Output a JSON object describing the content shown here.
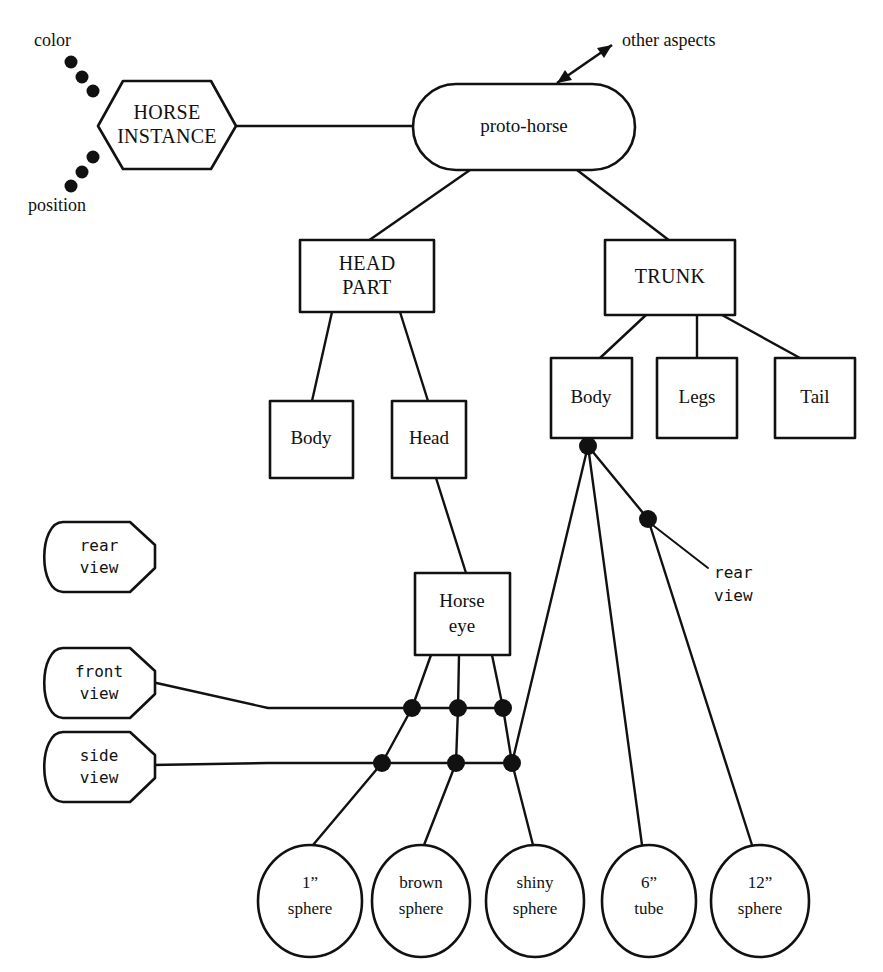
{
  "diagram": {
    "ink_color": "#111111",
    "background_color": "#ffffff",
    "instance_node": {
      "label_line1": "HORSE",
      "label_line2": "INSTANCE",
      "shape": "hexagon"
    },
    "prototype_node": {
      "label": "proto-horse",
      "shape": "stadium"
    },
    "annotations": {
      "color": "color",
      "position": "position",
      "other_aspects": "other aspects",
      "rear_view_body": "rear\nview",
      "rear_view_body_line1": "rear",
      "rear_view_body_line2": "view"
    },
    "part_nodes": [
      {
        "id": "head-part",
        "label_line1": "HEAD",
        "label_line2": "PART",
        "shape": "rect"
      },
      {
        "id": "trunk",
        "label_line1": "TRUNK",
        "label_line2": "",
        "shape": "rect"
      }
    ],
    "head_children": [
      {
        "id": "head-body",
        "label": "Body",
        "shape": "rect"
      },
      {
        "id": "head-head",
        "label": "Head",
        "shape": "rect"
      }
    ],
    "trunk_children": [
      {
        "id": "trunk-body",
        "label": "Body",
        "shape": "rect"
      },
      {
        "id": "trunk-legs",
        "label": "Legs",
        "shape": "rect"
      },
      {
        "id": "trunk-tail",
        "label": "Tail",
        "shape": "rect"
      }
    ],
    "eye_node": {
      "label_line1": "Horse",
      "label_line2": "eye",
      "shape": "rect"
    },
    "view_nodes": [
      {
        "id": "rear-view",
        "label_line1": "rear",
        "label_line2": "view",
        "shape": "flag"
      },
      {
        "id": "front-view",
        "label_line1": "front",
        "label_line2": "view",
        "shape": "flag"
      },
      {
        "id": "side-view",
        "label_line1": "side",
        "label_line2": "view",
        "shape": "flag"
      }
    ],
    "leaf_nodes": [
      {
        "id": "leaf-1in-sphere",
        "label_line1": "1”",
        "label_line2": "sphere",
        "shape": "ellipse"
      },
      {
        "id": "leaf-brown-sphere",
        "label_line1": "brown",
        "label_line2": "sphere",
        "shape": "ellipse"
      },
      {
        "id": "leaf-shiny-sphere",
        "label_line1": "shiny",
        "label_line2": "sphere",
        "shape": "ellipse"
      },
      {
        "id": "leaf-6in-tube",
        "label_line1": "6”",
        "label_line2": "tube",
        "shape": "ellipse"
      },
      {
        "id": "leaf-12in-sphere",
        "label_line1": "12”",
        "label_line2": "sphere",
        "shape": "ellipse"
      }
    ]
  }
}
